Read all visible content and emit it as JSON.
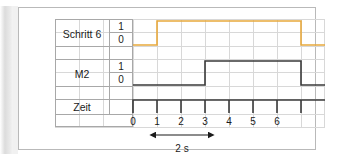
{
  "diagram": {
    "type": "timing-diagram",
    "title": "",
    "rows": [
      {
        "id": "schritt6",
        "label": "Schritt 6",
        "high_label": "1",
        "low_label": "0",
        "color": "#e8a93c"
      },
      {
        "id": "m2",
        "label": "M2",
        "high_label": "1",
        "low_label": "0",
        "color": "#3a3a3a"
      },
      {
        "id": "zeit",
        "label": "Zeit",
        "high_label": "",
        "low_label": "",
        "color": "#3a3a3a"
      }
    ],
    "time_axis": {
      "ticks": [
        "0",
        "1",
        "2",
        "3",
        "4",
        "5",
        "6"
      ],
      "tick_values": [
        0,
        1,
        2,
        3,
        4,
        5,
        6
      ],
      "unit": "s"
    },
    "signals": [
      {
        "name": "Schritt 6",
        "color": "#e8a93c",
        "transitions": [
          {
            "time": 0,
            "level": 0
          },
          {
            "time": 1,
            "level": 1
          },
          {
            "time": 6,
            "level": 0
          }
        ]
      },
      {
        "name": "M2",
        "color": "#3a3a3a",
        "transitions": [
          {
            "time": 0,
            "level": 0
          },
          {
            "time": 3,
            "level": 1
          },
          {
            "time": 6,
            "level": 0
          }
        ]
      }
    ],
    "annotation": {
      "label": "2 s",
      "from_time": 1,
      "to_time": 3,
      "arrow": "double-headed"
    },
    "colors": {
      "signal_orange": "#e8a93c",
      "signal_black": "#3a3a3a",
      "grid_line": "#d8d8d8",
      "table_border": "#a8a8a8",
      "card_border": "#b9b9b9",
      "background": "#ffffff"
    }
  }
}
